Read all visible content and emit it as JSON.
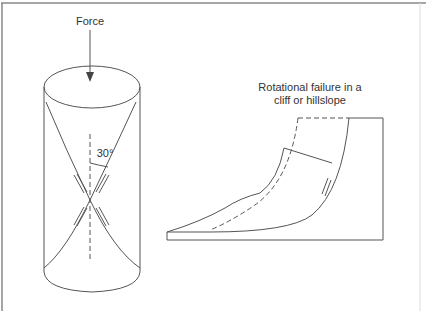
{
  "diagram": {
    "left_panel": {
      "force_label": "Force",
      "angle_label": "30°",
      "description": "Cylinder under vertical compressive force showing conjugate shear planes at 30° to the axis"
    },
    "right_panel": {
      "title_line1": "Rotational failure in a",
      "title_line2": "cliff or hillslope",
      "description": "Hillslope cross-section with curved slip surface; dashed line shows original slope profile"
    },
    "colors": {
      "line": "#555555",
      "text": "#333333",
      "frame": "#888888",
      "background": "#ffffff"
    }
  }
}
